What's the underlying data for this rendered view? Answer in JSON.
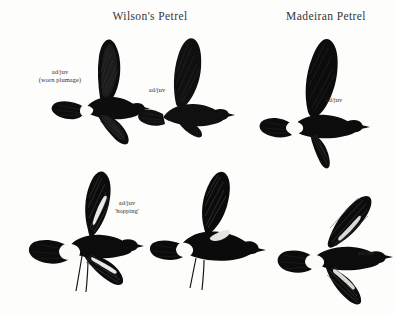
{
  "plate": {
    "background_color": "#fdfdfc",
    "ink_color": "#111111",
    "width": 396,
    "height": 315
  },
  "titles": [
    {
      "id": "wilsons",
      "text": "Wilson's Petrel",
      "x": 150,
      "y": 10
    },
    {
      "id": "madeiran",
      "text": "Madeiran Petrel",
      "x": 326,
      "y": 10
    }
  ],
  "captions": [
    {
      "id": "wilsons-upper-left",
      "line1": "ad/juv",
      "line2": "(worn plumage)",
      "x": 60,
      "y": 68
    },
    {
      "id": "wilsons-upper-right",
      "line1": "ad/juv",
      "line2": "",
      "x": 157,
      "y": 86
    },
    {
      "id": "madeiran-upper",
      "line1": "ad/juv",
      "line2": "",
      "x": 334,
      "y": 96
    },
    {
      "id": "wilsons-lower",
      "line1": "ad/juv",
      "line2": "'hopping'",
      "x": 127,
      "y": 199
    },
    {
      "id": "madeiran-lower",
      "line1": "ad/juv",
      "line2": "",
      "x": 366,
      "y": 249
    }
  ],
  "figures": [
    {
      "id": "wilsons-upper-left-bird",
      "species": "Wilson's Petrel",
      "plumage": "ad/juv (worn plumage)",
      "pose": "flight, wings raised, white rump band, square tail",
      "x": 40,
      "y": 38,
      "w": 125,
      "h": 108
    },
    {
      "id": "wilsons-upper-right-bird",
      "species": "Wilson's Petrel",
      "plumage": "ad/juv",
      "pose": "flight, wing raised, body dark, spread tail",
      "x": 140,
      "y": 38,
      "w": 110,
      "h": 100
    },
    {
      "id": "madeiran-upper-bird",
      "species": "Madeiran Petrel",
      "plumage": "ad/juv",
      "pose": "flight, wings raised, white rump, forked tail",
      "x": 256,
      "y": 32,
      "w": 120,
      "h": 110
    },
    {
      "id": "wilsons-lower-left-bird",
      "species": "Wilson's Petrel",
      "plumage": "ad/juv 'hopping'",
      "pose": "hopping on water, legs dangling, wings spread",
      "x": 24,
      "y": 172,
      "w": 120,
      "h": 120
    },
    {
      "id": "wilsons-lower-right-bird",
      "species": "Wilson's Petrel",
      "plumage": "ad/juv 'hopping'",
      "pose": "hopping on water, legs trailing, wing raised",
      "x": 150,
      "y": 172,
      "w": 115,
      "h": 118
    },
    {
      "id": "madeiran-lower-bird",
      "species": "Madeiran Petrel",
      "plumage": "ad/juv",
      "pose": "flight from below/above, wings spread, pale carpal bars, forked tail",
      "x": 272,
      "y": 190,
      "w": 120,
      "h": 118
    }
  ]
}
